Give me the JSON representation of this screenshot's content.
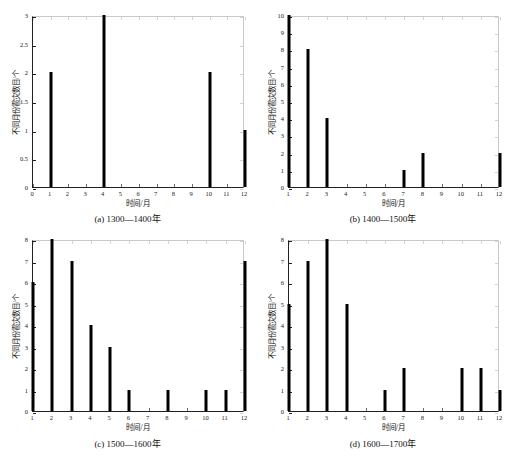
{
  "scan_header": {
    "text": ""
  },
  "common": {
    "xlabel": "时间/月",
    "ylabel": "不同月份雹灾数目/个"
  },
  "chart_data": [
    {
      "id": "a",
      "type": "bar",
      "title": "",
      "caption": "(a) 1300—1400年",
      "xlabel": "时间/月",
      "ylabel": "不同月份雹灾数目/个",
      "xlim": [
        0,
        12
      ],
      "ylim": [
        0,
        3
      ],
      "xticks": [
        0,
        1,
        2,
        3,
        4,
        5,
        6,
        7,
        8,
        9,
        10,
        11,
        12
      ],
      "xticklabels": [
        "0",
        "1",
        "2",
        "3",
        "4",
        "5",
        "6",
        "7",
        "8",
        "9",
        "10",
        "11",
        "12"
      ],
      "yticks": [
        0,
        0.5,
        1,
        1.5,
        2,
        2.5,
        3
      ],
      "yticklabels": [
        "0",
        "0.5",
        "1",
        "1.5",
        "2",
        "2.5",
        "3"
      ],
      "grid": false,
      "legend": null,
      "categories": [
        1,
        2,
        3,
        4,
        5,
        6,
        7,
        8,
        9,
        10,
        11,
        12
      ],
      "values": [
        2,
        0,
        0,
        3,
        0,
        0,
        0,
        0,
        0,
        2,
        0,
        1
      ]
    },
    {
      "id": "b",
      "type": "bar",
      "title": "",
      "caption": "(b) 1400—1500年",
      "xlabel": "时间/月",
      "ylabel": "不同月份雹灾数目/个",
      "xlim": [
        1,
        12
      ],
      "ylim": [
        0,
        10
      ],
      "xticks": [
        1,
        2,
        3,
        4,
        5,
        6,
        7,
        8,
        9,
        10,
        11,
        12
      ],
      "xticklabels": [
        "1",
        "2",
        "3",
        "4",
        "5",
        "6",
        "7",
        "8",
        "9",
        "10",
        "11",
        "12"
      ],
      "yticks": [
        0,
        1,
        2,
        3,
        4,
        5,
        6,
        7,
        8,
        9,
        10
      ],
      "yticklabels": [
        "0",
        "1",
        "2",
        "3",
        "4",
        "5",
        "6",
        "7",
        "8",
        "9",
        "10"
      ],
      "grid": false,
      "legend": null,
      "categories": [
        1,
        2,
        3,
        4,
        5,
        6,
        7,
        8,
        9,
        10,
        11,
        12
      ],
      "values": [
        10,
        8,
        4,
        0,
        0,
        0,
        1,
        2,
        0,
        0,
        0,
        2
      ]
    },
    {
      "id": "c",
      "type": "bar",
      "title": "",
      "caption": "(c) 1500—1600年",
      "xlabel": "时间/月",
      "ylabel": "不同月份雹灾数目/个",
      "xlim": [
        1,
        12
      ],
      "ylim": [
        0,
        8
      ],
      "xticks": [
        1,
        2,
        3,
        4,
        5,
        6,
        7,
        8,
        9,
        10,
        11,
        12
      ],
      "xticklabels": [
        "1",
        "2",
        "3",
        "4",
        "5",
        "6",
        "7",
        "8",
        "9",
        "10",
        "11",
        "12"
      ],
      "yticks": [
        0,
        1,
        2,
        3,
        4,
        5,
        6,
        7,
        8
      ],
      "yticklabels": [
        "0",
        "1",
        "2",
        "3",
        "4",
        "5",
        "6",
        "7",
        "8"
      ],
      "grid": false,
      "legend": null,
      "categories": [
        1,
        2,
        3,
        4,
        5,
        6,
        7,
        8,
        9,
        10,
        11,
        12
      ],
      "values": [
        6,
        8,
        7,
        4,
        3,
        1,
        0,
        1,
        0,
        1,
        1,
        7
      ]
    },
    {
      "id": "d",
      "type": "bar",
      "title": "",
      "caption": "(d) 1600—1700年",
      "xlabel": "时间/月",
      "ylabel": "不同月份雹灾数目/个",
      "xlim": [
        1,
        12
      ],
      "ylim": [
        0,
        8
      ],
      "xticks": [
        1,
        2,
        3,
        4,
        5,
        6,
        7,
        8,
        9,
        10,
        11,
        12
      ],
      "xticklabels": [
        "1",
        "2",
        "3",
        "4",
        "5",
        "6",
        "7",
        "8",
        "9",
        "10",
        "11",
        "12"
      ],
      "yticks": [
        0,
        1,
        2,
        3,
        4,
        5,
        6,
        7,
        8
      ],
      "yticklabels": [
        "0",
        "1",
        "2",
        "3",
        "4",
        "5",
        "6",
        "7",
        "8"
      ],
      "grid": false,
      "legend": null,
      "categories": [
        1,
        2,
        3,
        4,
        5,
        6,
        7,
        8,
        9,
        10,
        11,
        12
      ],
      "values": [
        5,
        7,
        8,
        5,
        0,
        1,
        2,
        0,
        0,
        2,
        2,
        1
      ]
    }
  ],
  "colors": {
    "bar": "#000000",
    "axis": "#231f20",
    "background": "#ffffff"
  }
}
